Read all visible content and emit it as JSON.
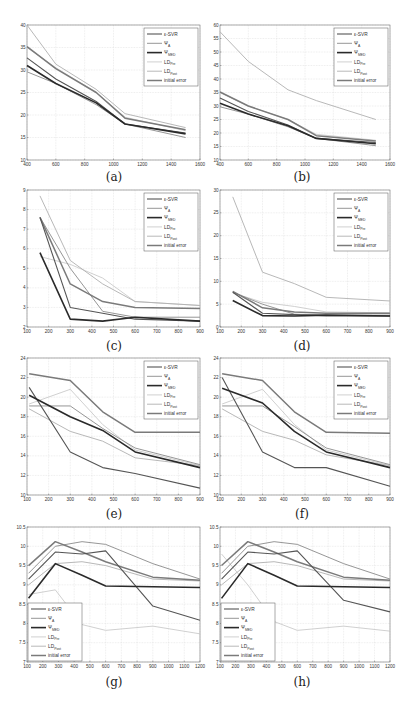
{
  "figure": {
    "legend_labels": [
      "ε-SVR",
      "Ψ_A",
      "Ψ_MED",
      "LD_Pre",
      "LD_Post",
      "initial error"
    ],
    "series_styles": [
      {
        "name": "ε-SVR",
        "color": "#555555",
        "width": 1.1
      },
      {
        "name": "Ψ_A",
        "color": "#8a8a8a",
        "width": 0.9
      },
      {
        "name": "Ψ_MED",
        "color": "#2a2a2a",
        "width": 1.6
      },
      {
        "name": "LD_Pre",
        "color": "#c4c4c4",
        "width": 0.8
      },
      {
        "name": "LD_Post",
        "color": "#b0b0b0",
        "width": 0.9
      },
      {
        "name": "initial error",
        "color": "#7a7a7a",
        "width": 1.5
      }
    ]
  },
  "chart_data": [
    {
      "id": "a",
      "caption": "(a)",
      "type": "line",
      "xlim": [
        400,
        1600
      ],
      "ylim": [
        10,
        40
      ],
      "xticks": [
        400,
        600,
        800,
        1000,
        1200,
        1400,
        1600
      ],
      "yticks": [
        10,
        15,
        20,
        25,
        30,
        35,
        40
      ],
      "grid": true,
      "legend_position": "upper right",
      "x": [
        400,
        600,
        880,
        1080,
        1500
      ],
      "series": [
        {
          "name": "ε-SVR",
          "values": [
            32.7,
            28.0,
            23.0,
            18.0,
            16.0
          ]
        },
        {
          "name": "Ψ_A",
          "values": [
            29.6,
            27.0,
            22.3,
            18.0,
            15.0
          ]
        },
        {
          "name": "Ψ_MED",
          "values": [
            31.0,
            27.0,
            22.7,
            18.0,
            15.8
          ]
        },
        {
          "name": "LD_Pre",
          "values": [
            35.0,
            30.5,
            25.0,
            19.5,
            16.5
          ]
        },
        {
          "name": "LD_Post",
          "values": [
            40.0,
            31.3,
            25.7,
            20.3,
            17.2
          ]
        },
        {
          "name": "initial error",
          "values": [
            35.2,
            30.3,
            25.0,
            19.3,
            16.7
          ]
        }
      ]
    },
    {
      "id": "b",
      "caption": "(b)",
      "type": "line",
      "xlim": [
        400,
        1600
      ],
      "ylim": [
        10,
        60
      ],
      "xticks": [
        400,
        600,
        800,
        1000,
        1200,
        1400,
        1600
      ],
      "yticks": [
        10,
        15,
        20,
        25,
        30,
        35,
        40,
        45,
        50,
        55,
        60
      ],
      "grid": true,
      "legend_position": "upper right",
      "x": [
        400,
        600,
        880,
        1080,
        1500
      ],
      "series": [
        {
          "name": "ε-SVR",
          "values": [
            33.0,
            28.0,
            23.0,
            18.0,
            16.5
          ]
        },
        {
          "name": "Ψ_A",
          "values": [
            29.7,
            27.0,
            22.3,
            18.0,
            15.3
          ]
        },
        {
          "name": "Ψ_MED",
          "values": [
            31.0,
            27.0,
            22.7,
            18.0,
            16.0
          ]
        },
        {
          "name": "LD_Pre",
          "values": [
            35.0,
            30.0,
            25.0,
            19.5,
            17.3
          ]
        },
        {
          "name": "LD_Post",
          "values": [
            57.5,
            46.5,
            36.0,
            32.0,
            25.0
          ]
        },
        {
          "name": "initial error",
          "values": [
            35.2,
            30.0,
            25.0,
            19.0,
            17.0
          ]
        }
      ]
    },
    {
      "id": "c",
      "caption": "(c)",
      "type": "line",
      "xlim": [
        100,
        900
      ],
      "ylim": [
        2,
        9
      ],
      "xticks": [
        100,
        200,
        300,
        400,
        500,
        600,
        700,
        800,
        900
      ],
      "yticks": [
        2,
        3,
        4,
        5,
        6,
        7,
        8,
        9
      ],
      "grid": true,
      "legend_position": "upper right",
      "x": [
        160,
        300,
        450,
        600,
        900
      ],
      "series": [
        {
          "name": "ε-SVR",
          "values": [
            7.6,
            3.0,
            2.7,
            2.4,
            2.3
          ]
        },
        {
          "name": "Ψ_A",
          "values": [
            7.6,
            5.0,
            2.8,
            2.5,
            2.5
          ]
        },
        {
          "name": "Ψ_MED",
          "values": [
            5.8,
            2.4,
            2.3,
            2.5,
            2.3
          ]
        },
        {
          "name": "LD_Pre",
          "values": [
            5.6,
            5.2,
            4.5,
            3.3,
            3.1
          ]
        },
        {
          "name": "LD_Post",
          "values": [
            8.7,
            5.4,
            4.2,
            3.3,
            3.1
          ]
        },
        {
          "name": "initial error",
          "values": [
            7.6,
            4.2,
            3.3,
            3.0,
            2.95
          ]
        }
      ]
    },
    {
      "id": "d",
      "caption": "(d)",
      "type": "line",
      "xlim": [
        100,
        900
      ],
      "ylim": [
        0,
        30
      ],
      "xticks": [
        100,
        200,
        300,
        400,
        500,
        600,
        700,
        800,
        900
      ],
      "yticks": [
        0,
        5,
        10,
        15,
        20,
        25,
        30
      ],
      "grid": true,
      "legend_position": "upper right",
      "x": [
        160,
        300,
        450,
        600,
        900
      ],
      "series": [
        {
          "name": "ε-SVR",
          "values": [
            7.6,
            3.0,
            2.7,
            2.5,
            2.4
          ]
        },
        {
          "name": "Ψ_A",
          "values": [
            7.6,
            5.0,
            2.8,
            2.6,
            2.6
          ]
        },
        {
          "name": "Ψ_MED",
          "values": [
            5.8,
            2.5,
            2.4,
            2.6,
            2.4
          ]
        },
        {
          "name": "LD_Pre",
          "values": [
            7.5,
            5.4,
            4.5,
            3.3,
            3.1
          ]
        },
        {
          "name": "LD_Post",
          "values": [
            28.5,
            12.0,
            9.5,
            6.5,
            5.7
          ]
        },
        {
          "name": "initial error",
          "values": [
            7.8,
            4.2,
            3.3,
            3.0,
            3.0
          ]
        }
      ]
    },
    {
      "id": "e",
      "caption": "(e)",
      "type": "line",
      "xlim": [
        100,
        900
      ],
      "ylim": [
        10,
        24
      ],
      "xticks": [
        100,
        200,
        300,
        400,
        500,
        600,
        700,
        800,
        900
      ],
      "yticks": [
        10,
        12,
        14,
        16,
        18,
        20,
        22,
        24
      ],
      "grid": true,
      "legend_position": "upper right",
      "x": [
        110,
        300,
        450,
        600,
        900
      ],
      "series": [
        {
          "name": "ε-SVR",
          "values": [
            21.0,
            14.4,
            12.8,
            12.2,
            10.7
          ]
        },
        {
          "name": "Ψ_A",
          "values": [
            19.1,
            19.1,
            16.8,
            14.8,
            13.1
          ]
        },
        {
          "name": "Ψ_MED",
          "values": [
            20.2,
            18.0,
            16.6,
            14.4,
            12.8
          ]
        },
        {
          "name": "LD_Pre",
          "values": [
            19.3,
            20.8,
            17.2,
            14.6,
            13.0
          ]
        },
        {
          "name": "LD_Post",
          "values": [
            18.8,
            16.5,
            15.5,
            13.8,
            13.0
          ]
        },
        {
          "name": "initial error",
          "values": [
            22.4,
            21.7,
            18.5,
            16.4,
            16.4
          ]
        }
      ]
    },
    {
      "id": "f",
      "caption": "(f)",
      "type": "line",
      "xlim": [
        100,
        900
      ],
      "ylim": [
        10,
        24
      ],
      "xticks": [
        100,
        200,
        300,
        400,
        500,
        600,
        700,
        800,
        900
      ],
      "yticks": [
        10,
        12,
        14,
        16,
        18,
        20,
        22,
        24
      ],
      "grid": true,
      "legend_position": "upper right",
      "x": [
        110,
        300,
        450,
        600,
        900
      ],
      "series": [
        {
          "name": "ε-SVR",
          "values": [
            22.0,
            14.4,
            12.8,
            12.8,
            10.9
          ]
        },
        {
          "name": "Ψ_A",
          "values": [
            19.1,
            19.1,
            17.0,
            14.8,
            13.1
          ]
        },
        {
          "name": "Ψ_MED",
          "values": [
            20.9,
            19.4,
            16.5,
            14.4,
            12.8
          ]
        },
        {
          "name": "LD_Pre",
          "values": [
            19.3,
            20.8,
            17.2,
            14.6,
            13.0
          ]
        },
        {
          "name": "LD_Post",
          "values": [
            18.8,
            16.5,
            15.6,
            14.1,
            13.0
          ]
        },
        {
          "name": "initial error",
          "values": [
            22.4,
            21.7,
            18.5,
            16.4,
            16.3
          ]
        }
      ]
    },
    {
      "id": "g",
      "caption": "(g)",
      "type": "line",
      "xlim": [
        100,
        1200
      ],
      "ylim": [
        7,
        10.5
      ],
      "xticks": [
        100,
        200,
        300,
        400,
        500,
        600,
        700,
        800,
        900,
        1000,
        1100,
        1200
      ],
      "yticks": [
        7,
        7.5,
        8,
        8.5,
        9,
        9.5,
        10,
        10.5
      ],
      "grid": true,
      "legend_position": "lower left",
      "x": [
        110,
        280,
        450,
        600,
        900,
        1200
      ],
      "series": [
        {
          "name": "ε-SVR",
          "values": [
            9.15,
            9.85,
            9.8,
            9.88,
            8.45,
            8.08
          ]
        },
        {
          "name": "Ψ_A",
          "values": [
            9.3,
            10.0,
            10.12,
            10.05,
            9.55,
            9.15
          ]
        },
        {
          "name": "Ψ_MED",
          "values": [
            8.65,
            9.55,
            9.25,
            8.97,
            8.95,
            8.93
          ]
        },
        {
          "name": "LD_Pre",
          "values": [
            8.75,
            8.87,
            7.97,
            7.82,
            7.93,
            7.73
          ]
        },
        {
          "name": "LD_Post",
          "values": [
            9.0,
            9.55,
            9.6,
            9.5,
            9.15,
            9.1
          ]
        },
        {
          "name": "initial error",
          "values": [
            9.5,
            10.12,
            9.85,
            9.6,
            9.2,
            9.12
          ]
        }
      ]
    },
    {
      "id": "h",
      "caption": "(h)",
      "type": "line",
      "xlim": [
        100,
        1200
      ],
      "ylim": [
        7,
        10.5
      ],
      "xticks": [
        100,
        200,
        300,
        400,
        500,
        600,
        700,
        800,
        900,
        1000,
        1100,
        1200
      ],
      "yticks": [
        7,
        7.5,
        8,
        8.5,
        9,
        9.5,
        10,
        10.5
      ],
      "grid": true,
      "legend_position": "lower left",
      "x": [
        110,
        280,
        450,
        600,
        900,
        1200
      ],
      "series": [
        {
          "name": "ε-SVR",
          "values": [
            9.15,
            9.85,
            9.8,
            9.88,
            8.6,
            8.3
          ]
        },
        {
          "name": "Ψ_A",
          "values": [
            9.3,
            10.0,
            10.12,
            10.05,
            9.55,
            9.15
          ]
        },
        {
          "name": "Ψ_MED",
          "values": [
            8.65,
            9.55,
            9.25,
            8.97,
            8.95,
            8.93
          ]
        },
        {
          "name": "LD_Pre",
          "values": [
            9.8,
            9.0,
            8.05,
            7.82,
            7.93,
            7.8
          ]
        },
        {
          "name": "LD_Post",
          "values": [
            9.0,
            9.55,
            9.6,
            9.5,
            9.15,
            9.1
          ]
        },
        {
          "name": "initial error",
          "values": [
            9.5,
            10.12,
            9.85,
            9.6,
            9.2,
            9.12
          ]
        }
      ]
    }
  ]
}
